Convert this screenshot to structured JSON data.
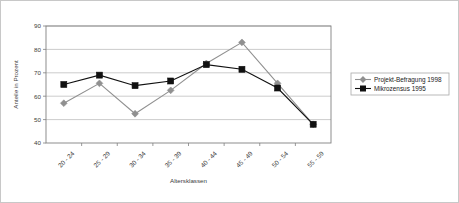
{
  "chart_data": {
    "type": "line",
    "title": "",
    "xlabel": "Altersklassen",
    "ylabel": "Anteile in Prozent",
    "categories": [
      "20 - 24",
      "25 - 29",
      "30 - 34",
      "35 - 39",
      "40 - 44",
      "45 - 49",
      "50 - 54",
      "55 - 59"
    ],
    "ylim": [
      40,
      90
    ],
    "yticks": [
      40,
      50,
      60,
      70,
      80,
      90
    ],
    "grid": "horizontal",
    "legend_position": "right",
    "series": [
      {
        "name": "Projekt-Befragung 1998",
        "color": "#909090",
        "marker": "diamond",
        "values": [
          57,
          65.5,
          52.5,
          62.5,
          74,
          83,
          65.5,
          48
        ]
      },
      {
        "name": "Mikrozensus 1995",
        "color": "#111111",
        "marker": "square",
        "values": [
          65,
          69,
          64.5,
          66.5,
          73.5,
          71.5,
          63.5,
          48
        ]
      }
    ]
  },
  "colors": {
    "frame_border": "#c8c8c8",
    "grid": "#bfbfbf",
    "axis": "#808080",
    "series_1": "#909090",
    "series_2": "#111111",
    "legend_border": "#a9a9a9",
    "background": "#ffffff"
  }
}
